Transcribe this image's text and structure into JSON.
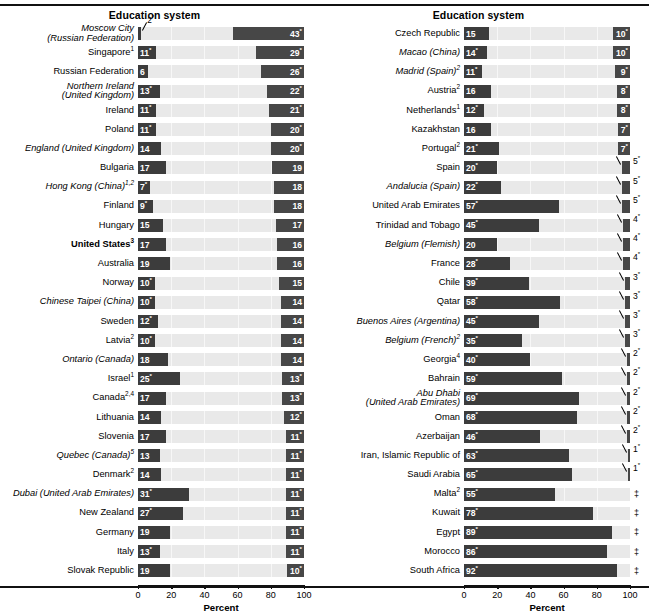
{
  "meta": {
    "column_header": "Education system",
    "axis_title": "Percent",
    "tick_labels": [
      "0",
      "20",
      "40",
      "60",
      "80",
      "100"
    ],
    "suppressed_symbol": "‡",
    "colors": {
      "bar_dark": "#3c3c3c",
      "bar_mid": "#474747",
      "track": "#e9e9e9",
      "text": "#000000"
    }
  },
  "chart_data": {
    "type": "bar",
    "title": "Education system",
    "xlabel": "Percent",
    "ylabel": "",
    "xlim": [
      0,
      100
    ],
    "ticks": [
      0,
      20,
      40,
      60,
      80,
      100
    ],
    "grid": true,
    "legend": "",
    "note": "Paired horizontal bars: left segment anchored at 0 (lower group), right segment anchored at 100 (upper group). Values with * are significantly different; ‡ means reporting standards not met.",
    "series": [
      {
        "name": "left_value"
      },
      {
        "name": "right_value"
      }
    ],
    "panels": [
      {
        "header": "Education system",
        "rows": [
          {
            "label": "Moscow City",
            "label2": "(Russian Federation)",
            "italic": true,
            "bold": false,
            "sup": "",
            "left": 2,
            "left_star": true,
            "right": 43,
            "right_star": true,
            "left_outside": true
          },
          {
            "label": "Singapore",
            "italic": false,
            "bold": false,
            "sup": "1",
            "left": 11,
            "left_star": true,
            "right": 29,
            "right_star": true
          },
          {
            "label": "Russian Federation",
            "italic": false,
            "bold": false,
            "sup": "",
            "left": 6,
            "left_star": false,
            "right": 26,
            "right_star": true
          },
          {
            "label": "Northern Ireland",
            "label2": "(United Kingdom)",
            "italic": true,
            "bold": false,
            "sup": "",
            "left": 13,
            "left_star": true,
            "right": 22,
            "right_star": true
          },
          {
            "label": "Ireland",
            "italic": false,
            "bold": false,
            "sup": "",
            "left": 11,
            "left_star": true,
            "right": 21,
            "right_star": true
          },
          {
            "label": "Poland",
            "italic": false,
            "bold": false,
            "sup": "",
            "left": 11,
            "left_star": true,
            "right": 20,
            "right_star": true
          },
          {
            "label": "England (United Kingdom)",
            "italic": true,
            "bold": false,
            "sup": "",
            "left": 14,
            "left_star": false,
            "right": 20,
            "right_star": true
          },
          {
            "label": "Bulgaria",
            "italic": false,
            "bold": false,
            "sup": "",
            "left": 17,
            "left_star": false,
            "right": 19,
            "right_star": false
          },
          {
            "label": "Hong Kong (China)",
            "italic": true,
            "bold": false,
            "sup": "1,2",
            "left": 7,
            "left_star": true,
            "right": 18,
            "right_star": false
          },
          {
            "label": "Finland",
            "italic": false,
            "bold": false,
            "sup": "",
            "left": 9,
            "left_star": true,
            "right": 18,
            "right_star": false
          },
          {
            "label": "Hungary",
            "italic": false,
            "bold": false,
            "sup": "",
            "left": 15,
            "left_star": false,
            "right": 17,
            "right_star": false
          },
          {
            "label": "United States",
            "italic": false,
            "bold": true,
            "sup": "3",
            "left": 17,
            "left_star": false,
            "right": 16,
            "right_star": false
          },
          {
            "label": "Australia",
            "italic": false,
            "bold": false,
            "sup": "",
            "left": 19,
            "left_star": false,
            "right": 16,
            "right_star": false
          },
          {
            "label": "Norway",
            "italic": false,
            "bold": false,
            "sup": "",
            "left": 10,
            "left_star": true,
            "right": 15,
            "right_star": false
          },
          {
            "label": "Chinese Taipei (China)",
            "italic": true,
            "bold": false,
            "sup": "",
            "left": 10,
            "left_star": true,
            "right": 14,
            "right_star": false
          },
          {
            "label": "Sweden",
            "italic": false,
            "bold": false,
            "sup": "",
            "left": 12,
            "left_star": true,
            "right": 14,
            "right_star": false
          },
          {
            "label": "Latvia",
            "italic": false,
            "bold": false,
            "sup": "2",
            "left": 10,
            "left_star": true,
            "right": 14,
            "right_star": false
          },
          {
            "label": "Ontario (Canada)",
            "italic": true,
            "bold": false,
            "sup": "",
            "left": 18,
            "left_star": false,
            "right": 14,
            "right_star": false
          },
          {
            "label": "Israel",
            "italic": false,
            "bold": false,
            "sup": "1",
            "left": 25,
            "left_star": true,
            "right": 13,
            "right_star": true
          },
          {
            "label": "Canada",
            "italic": false,
            "bold": false,
            "sup": "2,4",
            "left": 17,
            "left_star": false,
            "right": 13,
            "right_star": true
          },
          {
            "label": "Lithuania",
            "italic": false,
            "bold": false,
            "sup": "",
            "left": 14,
            "left_star": false,
            "right": 12,
            "right_star": true
          },
          {
            "label": "Slovenia",
            "italic": false,
            "bold": false,
            "sup": "",
            "left": 17,
            "left_star": false,
            "right": 11,
            "right_star": true
          },
          {
            "label": "Quebec (Canada)",
            "italic": true,
            "bold": false,
            "sup": "5",
            "left": 13,
            "left_star": false,
            "right": 11,
            "right_star": true
          },
          {
            "label": "Denmark",
            "italic": false,
            "bold": false,
            "sup": "2",
            "left": 14,
            "left_star": false,
            "right": 11,
            "right_star": true
          },
          {
            "label": "Dubai (United Arab Emirates)",
            "italic": true,
            "bold": false,
            "sup": "",
            "left": 31,
            "left_star": true,
            "right": 11,
            "right_star": true
          },
          {
            "label": "New Zealand",
            "italic": false,
            "bold": false,
            "sup": "",
            "left": 27,
            "left_star": true,
            "right": 11,
            "right_star": true
          },
          {
            "label": "Germany",
            "italic": false,
            "bold": false,
            "sup": "",
            "left": 19,
            "left_star": false,
            "right": 11,
            "right_star": true
          },
          {
            "label": "Italy",
            "italic": false,
            "bold": false,
            "sup": "",
            "left": 13,
            "left_star": true,
            "right": 11,
            "right_star": true
          },
          {
            "label": "Slovak Republic",
            "italic": false,
            "bold": false,
            "sup": "",
            "left": 19,
            "left_star": false,
            "right": 10,
            "right_star": true
          }
        ]
      },
      {
        "header": "Education system",
        "rows": [
          {
            "label": "Czech Republic",
            "italic": false,
            "bold": false,
            "sup": "",
            "left": 15,
            "left_star": false,
            "right": 10,
            "right_star": true
          },
          {
            "label": "Macao (China)",
            "italic": true,
            "bold": false,
            "sup": "",
            "left": 14,
            "left_star": true,
            "right": 10,
            "right_star": true
          },
          {
            "label": "Madrid (Spain)",
            "italic": true,
            "bold": false,
            "sup": "2",
            "left": 11,
            "left_star": true,
            "right": 9,
            "right_star": true
          },
          {
            "label": "Austria",
            "italic": false,
            "bold": false,
            "sup": "2",
            "left": 16,
            "left_star": false,
            "right": 8,
            "right_star": true
          },
          {
            "label": "Netherlands",
            "italic": false,
            "bold": false,
            "sup": "1",
            "left": 12,
            "left_star": true,
            "right": 8,
            "right_star": true
          },
          {
            "label": "Kazakhstan",
            "italic": false,
            "bold": false,
            "sup": "",
            "left": 16,
            "left_star": false,
            "right": 7,
            "right_star": true
          },
          {
            "label": "Portugal",
            "italic": false,
            "bold": false,
            "sup": "2",
            "left": 21,
            "left_star": true,
            "right": 7,
            "right_star": true
          },
          {
            "label": "Spain",
            "italic": false,
            "bold": false,
            "sup": "",
            "left": 20,
            "left_star": true,
            "right": 5,
            "right_star": true,
            "right_outside": true
          },
          {
            "label": "Andalucia (Spain)",
            "italic": true,
            "bold": false,
            "sup": "",
            "left": 22,
            "left_star": true,
            "right": 5,
            "right_star": true,
            "right_outside": true
          },
          {
            "label": "United Arab Emirates",
            "italic": false,
            "bold": false,
            "sup": "",
            "left": 57,
            "left_star": true,
            "right": 5,
            "right_star": true,
            "right_outside": true
          },
          {
            "label": "Trinidad and Tobago",
            "italic": false,
            "bold": false,
            "sup": "",
            "left": 45,
            "left_star": true,
            "right": 4,
            "right_star": true,
            "right_outside": true
          },
          {
            "label": "Belgium (Flemish)",
            "italic": true,
            "bold": false,
            "sup": "",
            "left": 20,
            "left_star": false,
            "right": 4,
            "right_star": true,
            "right_outside": true
          },
          {
            "label": "France",
            "italic": false,
            "bold": false,
            "sup": "",
            "left": 28,
            "left_star": true,
            "right": 4,
            "right_star": true,
            "right_outside": true
          },
          {
            "label": "Chile",
            "italic": false,
            "bold": false,
            "sup": "",
            "left": 39,
            "left_star": true,
            "right": 3,
            "right_star": true,
            "right_outside": true
          },
          {
            "label": "Qatar",
            "italic": false,
            "bold": false,
            "sup": "",
            "left": 58,
            "left_star": true,
            "right": 3,
            "right_star": true,
            "right_outside": true
          },
          {
            "label": "Buenos Aires (Argentina)",
            "italic": true,
            "bold": false,
            "sup": "",
            "left": 45,
            "left_star": true,
            "right": 3,
            "right_star": true,
            "right_outside": true
          },
          {
            "label": "Belgium (French)",
            "italic": true,
            "bold": false,
            "sup": "2",
            "left": 35,
            "left_star": true,
            "right": 3,
            "right_star": true,
            "right_outside": true
          },
          {
            "label": "Georgia",
            "italic": false,
            "bold": false,
            "sup": "4",
            "left": 40,
            "left_star": true,
            "right": 2,
            "right_star": true,
            "right_outside": true
          },
          {
            "label": "Bahrain",
            "italic": false,
            "bold": false,
            "sup": "",
            "left": 59,
            "left_star": true,
            "right": 2,
            "right_star": true,
            "right_outside": true
          },
          {
            "label": "Abu Dhabi",
            "label2": "(United Arab Emirates)",
            "italic": true,
            "bold": false,
            "sup": "",
            "left": 69,
            "left_star": true,
            "right": 2,
            "right_star": true,
            "right_outside": true
          },
          {
            "label": "Oman",
            "italic": false,
            "bold": false,
            "sup": "",
            "left": 68,
            "left_star": true,
            "right": 2,
            "right_star": true,
            "right_outside": true
          },
          {
            "label": "Azerbaijan",
            "italic": false,
            "bold": false,
            "sup": "",
            "left": 46,
            "left_star": true,
            "right": 2,
            "right_star": true,
            "right_outside": true
          },
          {
            "label": "Iran, Islamic Republic of",
            "italic": false,
            "bold": false,
            "sup": "",
            "left": 63,
            "left_star": true,
            "right": 1,
            "right_star": true,
            "right_outside": true
          },
          {
            "label": "Saudi Arabia",
            "italic": false,
            "bold": false,
            "sup": "",
            "left": 65,
            "left_star": true,
            "right": 1,
            "right_star": true,
            "right_outside": true
          },
          {
            "label": "Malta",
            "italic": false,
            "bold": false,
            "sup": "2",
            "left": 55,
            "left_star": true,
            "right": null,
            "suppressed": true
          },
          {
            "label": "Kuwait",
            "italic": false,
            "bold": false,
            "sup": "",
            "left": 78,
            "left_star": true,
            "right": null,
            "suppressed": true
          },
          {
            "label": "Egypt",
            "italic": false,
            "bold": false,
            "sup": "",
            "left": 89,
            "left_star": true,
            "right": null,
            "suppressed": true
          },
          {
            "label": "Morocco",
            "italic": false,
            "bold": false,
            "sup": "",
            "left": 86,
            "left_star": true,
            "right": null,
            "suppressed": true
          },
          {
            "label": "South Africa",
            "italic": false,
            "bold": false,
            "sup": "",
            "left": 92,
            "left_star": true,
            "right": null,
            "suppressed": true
          }
        ]
      }
    ]
  }
}
